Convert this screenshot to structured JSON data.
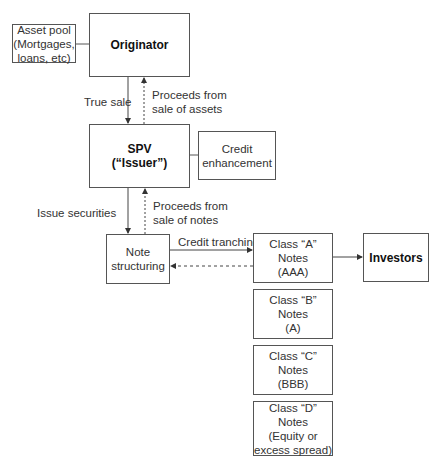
{
  "nodes": {
    "asset_pool": [
      "Asset pool",
      "(Mortgages,",
      "loans, etc)"
    ],
    "originator": [
      "Originator"
    ],
    "spv": [
      "SPV",
      "(“Issuer”)"
    ],
    "credit_enhancement": [
      "Credit",
      "enhancement"
    ],
    "note_structuring": [
      "Note",
      "structuring"
    ],
    "class_a": [
      "Class “A” Notes",
      "(AAA)"
    ],
    "investors": [
      "Investors"
    ],
    "class_b": [
      "Class “B” Notes",
      "(A)"
    ],
    "class_c": [
      "Class “C” Notes",
      "(BBB)"
    ],
    "class_d": [
      "Class “D” Notes",
      "(Equity or",
      "excess spread)"
    ]
  },
  "edges": {
    "true_sale": "True sale",
    "proceeds_assets": [
      "Proceeds from",
      "sale of assets"
    ],
    "issue_securities": "Issue securities",
    "proceeds_notes": [
      "Proceeds from",
      "sale of notes"
    ],
    "credit_tranching": "Credit tranching"
  },
  "colors": {
    "line": "#555555",
    "text": "#333333"
  }
}
